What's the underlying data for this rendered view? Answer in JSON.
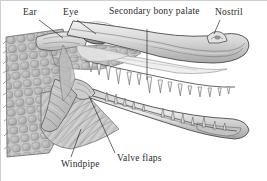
{
  "figure": {
    "background_color": "#ffffff",
    "ink_color": "#2b2b2b",
    "border_color": "#cfcfcf"
  },
  "labels": [
    {
      "id": "ear",
      "text": "Ear",
      "x": 22,
      "y": 6,
      "width": 30
    },
    {
      "id": "eye",
      "text": "Eye",
      "x": 62,
      "y": 6,
      "width": 30
    },
    {
      "id": "palate",
      "text": "Secondary bony palate",
      "x": 108,
      "y": 5,
      "width": 78
    },
    {
      "id": "nostril",
      "text": "Nostril",
      "x": 214,
      "y": 6,
      "width": 44
    },
    {
      "id": "windpipe",
      "text": "Windpipe",
      "x": 60,
      "y": 158,
      "width": 50
    },
    {
      "id": "valve",
      "text": "Valve flaps",
      "x": 116,
      "y": 152,
      "width": 58
    }
  ],
  "leader_lines": [
    {
      "id": "ear-leader",
      "x1": 38,
      "y1": 19,
      "x2": 62,
      "y2": 37
    },
    {
      "id": "eye-leader",
      "x1": 76,
      "y1": 19,
      "x2": 95,
      "y2": 33
    },
    {
      "id": "palate-leader",
      "x1": 146,
      "y1": 28,
      "x2": 146,
      "y2": 79
    },
    {
      "id": "nostril-leader",
      "x1": 219,
      "y1": 19,
      "x2": 213,
      "y2": 33
    },
    {
      "id": "windpipe-leader",
      "x1": 70,
      "y1": 156,
      "x2": 80,
      "y2": 128
    },
    {
      "id": "valve-leader",
      "x1": 114,
      "y1": 152,
      "x2": 88,
      "y2": 95
    }
  ],
  "anatomy_parts": [
    {
      "id": "scaly-neck",
      "name": "Scaly neck skin"
    },
    {
      "id": "ear-flap",
      "name": "Ear flap"
    },
    {
      "id": "eye",
      "name": "Eye with pupil"
    },
    {
      "id": "upper-jaw",
      "name": "Upper jaw / snout"
    },
    {
      "id": "lower-jaw",
      "name": "Lower jaw"
    },
    {
      "id": "upper-teeth",
      "name": "Upper teeth row"
    },
    {
      "id": "lower-teeth",
      "name": "Lower teeth row"
    },
    {
      "id": "secondary-palate",
      "name": "Secondary bony palate"
    },
    {
      "id": "throat-muscles",
      "name": "Throat musculature"
    },
    {
      "id": "windpipe",
      "name": "Windpipe (trachea)"
    },
    {
      "id": "valve-flaps",
      "name": "Valve flaps"
    },
    {
      "id": "nostril",
      "name": "Nostril"
    }
  ]
}
